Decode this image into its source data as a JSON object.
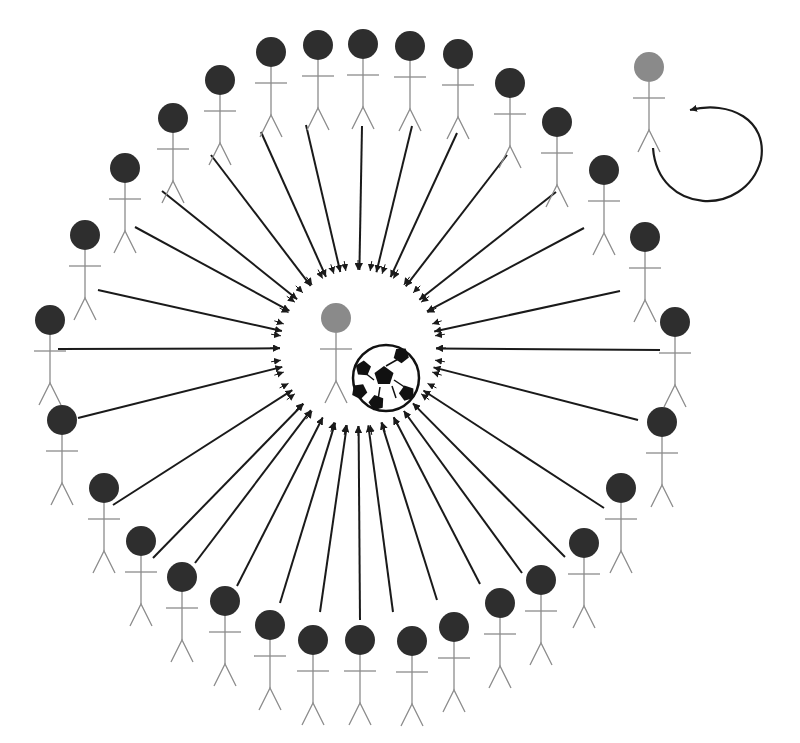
{
  "diagram": {
    "title": "Circle passing drill: players pass toward center player with ball",
    "colors": {
      "background": "#ffffff",
      "player_head": "#2e2e2e",
      "highlight_head": "#8a8a8a",
      "body_stroke": "#8c8c8c",
      "arrow": "#1a1a1a"
    },
    "center": {
      "x": 358,
      "y": 348
    },
    "arrowhead_ring_radius": 78,
    "center_player": {
      "x": 336,
      "y": 318,
      "role": "receiver"
    },
    "ball": {
      "x": 386,
      "y": 378,
      "r": 33
    },
    "rotating_player": {
      "x": 649,
      "y": 67
    },
    "rotation_arrow": {
      "start": [
        655,
        148
      ],
      "end": [
        684,
        108
      ]
    },
    "players": [
      {
        "x": 50,
        "y": 320,
        "lx": 58,
        "ly": 349
      },
      {
        "x": 85,
        "y": 235,
        "lx": 98,
        "ly": 290
      },
      {
        "x": 125,
        "y": 168,
        "lx": 135,
        "ly": 227
      },
      {
        "x": 173,
        "y": 118,
        "lx": 162,
        "ly": 191
      },
      {
        "x": 220,
        "y": 80,
        "lx": 211,
        "ly": 155
      },
      {
        "x": 271,
        "y": 52,
        "lx": 261,
        "ly": 132
      },
      {
        "x": 318,
        "y": 45,
        "lx": 306,
        "ly": 125
      },
      {
        "x": 363,
        "y": 44,
        "lx": 362,
        "ly": 126
      },
      {
        "x": 410,
        "y": 46,
        "lx": 412,
        "ly": 126
      },
      {
        "x": 458,
        "y": 54,
        "lx": 457,
        "ly": 133
      },
      {
        "x": 510,
        "y": 83,
        "lx": 507,
        "ly": 155
      },
      {
        "x": 557,
        "y": 122,
        "lx": 556,
        "ly": 192
      },
      {
        "x": 604,
        "y": 170,
        "lx": 584,
        "ly": 228
      },
      {
        "x": 645,
        "y": 237,
        "lx": 620,
        "ly": 291
      },
      {
        "x": 675,
        "y": 322,
        "lx": 660,
        "ly": 350
      },
      {
        "x": 662,
        "y": 422,
        "lx": 638,
        "ly": 420
      },
      {
        "x": 621,
        "y": 488,
        "lx": 604,
        "ly": 508
      },
      {
        "x": 584,
        "y": 543,
        "lx": 565,
        "ly": 557
      },
      {
        "x": 541,
        "y": 580,
        "lx": 522,
        "ly": 573
      },
      {
        "x": 500,
        "y": 603,
        "lx": 480,
        "ly": 584
      },
      {
        "x": 454,
        "y": 627,
        "lx": 437,
        "ly": 600
      },
      {
        "x": 412,
        "y": 641,
        "lx": 393,
        "ly": 612
      },
      {
        "x": 360,
        "y": 640,
        "lx": 360,
        "ly": 620
      },
      {
        "x": 313,
        "y": 640,
        "lx": 320,
        "ly": 612
      },
      {
        "x": 270,
        "y": 625,
        "lx": 280,
        "ly": 603
      },
      {
        "x": 225,
        "y": 601,
        "lx": 237,
        "ly": 586
      },
      {
        "x": 182,
        "y": 577,
        "lx": 195,
        "ly": 563
      },
      {
        "x": 141,
        "y": 541,
        "lx": 153,
        "ly": 558
      },
      {
        "x": 104,
        "y": 488,
        "lx": 113,
        "ly": 505
      },
      {
        "x": 62,
        "y": 420,
        "lx": 78,
        "ly": 418
      }
    ]
  }
}
